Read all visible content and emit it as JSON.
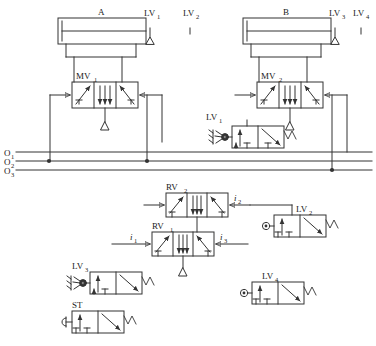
{
  "diagram": {
    "type": "pneumatic-schematic",
    "background": "#ffffff",
    "line_color": "#333333",
    "text_color": "#1a1a1a"
  },
  "cylinders": [
    {
      "id": "cyl-a",
      "label": "A",
      "x": 58,
      "y": 18,
      "w": 88,
      "h": 26
    },
    {
      "id": "cyl-b",
      "label": "B",
      "x": 243,
      "y": 18,
      "w": 88,
      "h": 26
    }
  ],
  "limit_valves": [
    {
      "id": "lv1-top",
      "label": "LV",
      "sub": "1",
      "x": 152,
      "y": 18
    },
    {
      "id": "lv2-top",
      "label": "LV",
      "sub": "2",
      "x": 192,
      "y": 18
    },
    {
      "id": "lv3-top",
      "label": "LV",
      "sub": "3",
      "x": 337,
      "y": 18
    },
    {
      "id": "lv4-top",
      "label": "LV",
      "sub": "4",
      "x": 361,
      "y": 18
    }
  ],
  "main_valves": [
    {
      "id": "mv1",
      "label": "MV",
      "sub": "1",
      "x": 72,
      "y": 82,
      "w": 66,
      "h": 26
    },
    {
      "id": "mv2",
      "label": "MV",
      "sub": "2",
      "x": 257,
      "y": 82,
      "w": 66,
      "h": 26
    }
  ],
  "relay_valves": [
    {
      "id": "rv2",
      "label": "RV",
      "sub": "2",
      "x": 166,
      "y": 193,
      "w": 62,
      "h": 24
    },
    {
      "id": "rv1",
      "label": "RV",
      "sub": "1",
      "x": 152,
      "y": 232,
      "w": 62,
      "h": 24
    }
  ],
  "signal_valves": [
    {
      "id": "lv1",
      "label": "LV",
      "sub": "1",
      "actuator": "roller",
      "x": 232,
      "y": 126,
      "w": 52,
      "h": 22
    },
    {
      "id": "lv2",
      "label": "LV",
      "sub": "2",
      "actuator": "plunger",
      "x": 274,
      "y": 215,
      "w": 52,
      "h": 22
    },
    {
      "id": "lv3",
      "label": "LV",
      "sub": "3",
      "actuator": "roller",
      "x": 90,
      "y": 272,
      "w": 52,
      "h": 22
    },
    {
      "id": "lv4",
      "label": "LV",
      "sub": "4",
      "actuator": "plunger",
      "x": 252,
      "y": 282,
      "w": 52,
      "h": 22
    },
    {
      "id": "st",
      "label": "ST",
      "sub": "",
      "actuator": "button",
      "x": 72,
      "y": 311,
      "w": 52,
      "h": 22
    }
  ],
  "supply_lines": [
    {
      "id": "o1",
      "label": "O",
      "sub": "1",
      "y": 152
    },
    {
      "id": "o2",
      "label": "O",
      "sub": "2",
      "y": 161
    },
    {
      "id": "o3",
      "label": "O",
      "sub": "3",
      "y": 170
    }
  ],
  "port_labels": [
    {
      "id": "i1",
      "label": "i",
      "sub": "1",
      "x": 132,
      "y": 236
    },
    {
      "id": "i2",
      "label": "i",
      "sub": "2",
      "x": 236,
      "y": 198
    },
    {
      "id": "i3",
      "label": "i",
      "sub": "3",
      "x": 222,
      "y": 236
    }
  ],
  "spring_symbol": "M",
  "junction_dots": [
    {
      "x": 49,
      "y": 161
    },
    {
      "x": 147,
      "y": 161
    },
    {
      "x": 332,
      "y": 170
    }
  ]
}
